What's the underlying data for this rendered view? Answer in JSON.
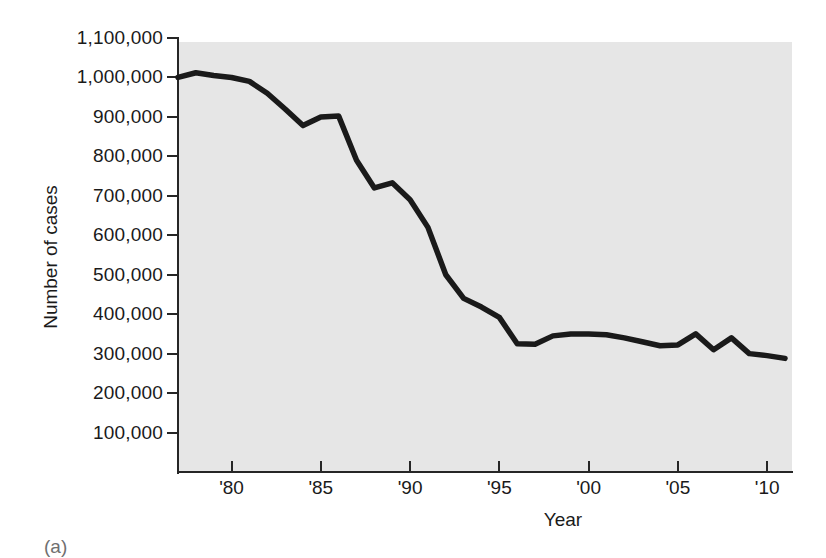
{
  "figure": {
    "background_color": "#ffffff",
    "panel_color": "#e6e6e6",
    "line_color": "#1a1a1a",
    "caption": "(a)"
  },
  "chart_data": {
    "type": "line",
    "title": "",
    "subtitle": "",
    "xlabel": "Year",
    "ylabel": "Number of cases",
    "grid": false,
    "legend": "none",
    "xlim": [
      1977,
      2011
    ],
    "ylim": [
      0,
      1100000
    ],
    "ytick_values": [
      100000,
      200000,
      300000,
      400000,
      500000,
      600000,
      700000,
      800000,
      900000,
      1000000,
      1100000
    ],
    "ytick_labels": [
      "100,000",
      "200,000",
      "300,000",
      "400,000",
      "500,000",
      "600,000",
      "700,000",
      "800,000",
      "900,000",
      "1,000,000",
      "1,100,000"
    ],
    "xtick_values": [
      1980,
      1985,
      1990,
      1995,
      2000,
      2005,
      2010
    ],
    "xtick_labels": [
      "'80",
      "'85",
      "'90",
      "'95",
      "'00",
      "'05",
      "'10"
    ],
    "series": [
      {
        "name": "Number of cases",
        "x": [
          1977,
          1978,
          1979,
          1980,
          1981,
          1982,
          1983,
          1984,
          1985,
          1986,
          1987,
          1988,
          1989,
          1990,
          1991,
          1992,
          1993,
          1994,
          1995,
          1996,
          1997,
          1998,
          1999,
          2000,
          2001,
          2002,
          2003,
          2004,
          2005,
          2006,
          2007,
          2008,
          2009,
          2010,
          2011
        ],
        "values": [
          1000000,
          1012000,
          1005000,
          1000000,
          990000,
          960000,
          920000,
          878000,
          900000,
          902000,
          790000,
          720000,
          733000,
          690000,
          620000,
          500000,
          440000,
          418000,
          392000,
          325000,
          324000,
          345000,
          350000,
          350000,
          348000,
          340000,
          330000,
          320000,
          322000,
          350000,
          310000,
          340000,
          300000,
          295000,
          288000
        ]
      }
    ]
  },
  "axis": {
    "y_title": "Number of cases",
    "x_title": "Year"
  }
}
